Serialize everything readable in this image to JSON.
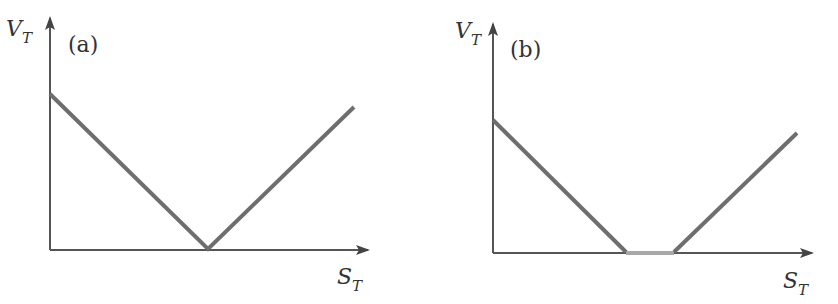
{
  "panels": [
    {
      "label": "(a)",
      "y_axis_label": "V",
      "y_axis_sub": "T",
      "x_axis_label": "S",
      "x_axis_sub": "T",
      "description": "V-shaped payoff: decreasing line to a single kink on the x-axis, then increasing"
    },
    {
      "label": "(b)",
      "y_axis_label": "V",
      "y_axis_sub": "T",
      "x_axis_label": "S",
      "x_axis_sub": "T",
      "description": "Payoff decreasing to zero, flat zero region, then increasing"
    }
  ],
  "colors": {
    "axis": "#555555",
    "payoff": "#6e6e6e",
    "flat_segment": "#a8a8a8",
    "text": "#333333"
  }
}
